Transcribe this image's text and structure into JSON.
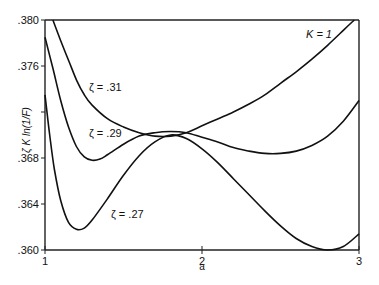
{
  "chart_data": {
    "type": "line",
    "title": "",
    "annotation": "K = 1",
    "xlabel": "a",
    "ylabel": "ζ K ln(1/F)",
    "xlim": [
      1,
      3
    ],
    "ylim": [
      0.36,
      0.38
    ],
    "grid": false,
    "legend": "inline curve labels",
    "x_ticks": [
      {
        "value": 1,
        "label": "1"
      },
      {
        "value": 2,
        "label": "2"
      },
      {
        "value": 3,
        "label": "3"
      }
    ],
    "y_ticks": [
      {
        "value": 0.36,
        "label": ".360"
      },
      {
        "value": 0.364,
        "label": ".364"
      },
      {
        "value": 0.368,
        "label": ".368"
      },
      {
        "value": 0.372,
        "label": ""
      },
      {
        "value": 0.376,
        "label": ".376"
      },
      {
        "value": 0.38,
        "label": ".380"
      }
    ],
    "series": [
      {
        "name": "ζ = .31",
        "label_pos": {
          "a": 1.28,
          "y": 0.3738
        },
        "x": [
          1.05,
          1.1,
          1.15,
          1.2,
          1.25,
          1.3,
          1.4,
          1.5,
          1.6,
          1.7,
          1.8,
          1.9,
          2.0,
          2.1,
          2.2,
          2.3,
          2.4,
          2.5,
          2.6,
          2.7,
          2.8,
          2.9,
          2.97
        ],
        "y": [
          0.38,
          0.3782,
          0.3765,
          0.3748,
          0.3735,
          0.3726,
          0.3714,
          0.3707,
          0.3702,
          0.3699,
          0.3699,
          0.3702,
          0.3708,
          0.3714,
          0.372,
          0.3727,
          0.3735,
          0.3745,
          0.3755,
          0.3766,
          0.3778,
          0.3791,
          0.38
        ]
      },
      {
        "name": "ζ = .29",
        "label_pos": {
          "a": 1.28,
          "y": 0.3698
        },
        "x": [
          1.0,
          1.05,
          1.1,
          1.15,
          1.2,
          1.25,
          1.3,
          1.35,
          1.4,
          1.5,
          1.6,
          1.7,
          1.8,
          1.9,
          2.0,
          2.1,
          2.2,
          2.3,
          2.4,
          2.5,
          2.6,
          2.7,
          2.8,
          2.9,
          3.0
        ],
        "y": [
          0.3785,
          0.3758,
          0.373,
          0.3707,
          0.369,
          0.3681,
          0.3678,
          0.3679,
          0.3683,
          0.3692,
          0.3699,
          0.3702,
          0.3703,
          0.3702,
          0.3698,
          0.3694,
          0.3689,
          0.3686,
          0.3684,
          0.3684,
          0.3686,
          0.3691,
          0.3699,
          0.3712,
          0.373
        ]
      },
      {
        "name": "ζ = .27",
        "label_pos": {
          "a": 1.42,
          "y": 0.3628
        },
        "x": [
          1.0,
          1.03,
          1.06,
          1.1,
          1.15,
          1.2,
          1.25,
          1.3,
          1.4,
          1.5,
          1.6,
          1.7,
          1.8,
          1.9,
          2.0,
          2.1,
          2.2,
          2.3,
          2.4,
          2.5,
          2.6,
          2.7,
          2.8,
          2.9,
          3.0
        ],
        "y": [
          0.3735,
          0.37,
          0.367,
          0.3643,
          0.3624,
          0.3618,
          0.3619,
          0.3626,
          0.3645,
          0.3665,
          0.3682,
          0.3694,
          0.37,
          0.3697,
          0.3688,
          0.3676,
          0.3662,
          0.3648,
          0.3634,
          0.3621,
          0.361,
          0.3603,
          0.36,
          0.3603,
          0.3614
        ]
      }
    ]
  }
}
